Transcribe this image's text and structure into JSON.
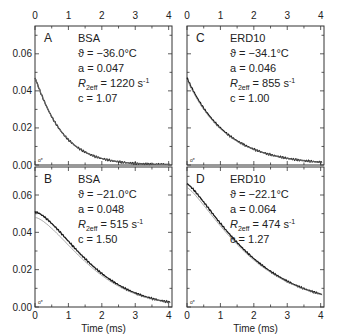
{
  "figure": {
    "top_axis_ticks": [
      "0",
      "1",
      "2",
      "3",
      "4"
    ],
    "bottom_axis_ticks": [
      "0",
      "1",
      "2",
      "3",
      "4"
    ],
    "xlabel": "Time (ms)",
    "y_ticks": [
      "0.00",
      "0.02",
      "0.04",
      "0.06"
    ]
  },
  "chart_data": [
    {
      "type": "line",
      "panel": "A",
      "sample": "BSA",
      "annotations": {
        "theta": "ϑ = −36.0°C",
        "a": "a = 0.047",
        "r2eff_value": "= 1220 s",
        "c": "c = 1.07"
      },
      "params": {
        "theta_C": -36.0,
        "a": 0.047,
        "R2eff_per_s": 1220,
        "c": 1.07
      },
      "x": [
        0,
        0.25,
        0.5,
        0.75,
        1,
        1.5,
        2,
        2.5,
        3,
        3.5,
        4
      ],
      "values": [
        0.047,
        0.034,
        0.025,
        0.018,
        0.013,
        0.007,
        0.004,
        0.002,
        0.001,
        0.0005,
        0.0003
      ],
      "xlabel": "",
      "ylabel": "",
      "xlim": [
        0,
        4.1
      ],
      "ylim": [
        0,
        0.075
      ]
    },
    {
      "type": "line",
      "panel": "B",
      "sample": "BSA",
      "annotations": {
        "theta": "ϑ = −21.0°C",
        "a": "a = 0.048",
        "r2eff_value": "= 515 s",
        "c": "c = 1.50"
      },
      "params": {
        "theta_C": -21.0,
        "a": 0.048,
        "R2eff_per_s": 515,
        "c": 1.5
      },
      "x": [
        0,
        0.25,
        0.5,
        0.75,
        1,
        1.5,
        2,
        2.5,
        3,
        3.5,
        4
      ],
      "values": [
        0.051,
        0.046,
        0.041,
        0.036,
        0.031,
        0.022,
        0.015,
        0.01,
        0.006,
        0.004,
        0.002
      ],
      "xlabel": "Time (ms)",
      "ylabel": "",
      "xlim": [
        0,
        4.1
      ],
      "ylim": [
        0,
        0.075
      ]
    },
    {
      "type": "line",
      "panel": "C",
      "sample": "ERD10",
      "annotations": {
        "theta": "ϑ = −34.1°C",
        "a": "a = 0.046",
        "r2eff_value": "= 855 s",
        "c": "c = 1.00"
      },
      "params": {
        "theta_C": -34.1,
        "a": 0.046,
        "R2eff_per_s": 855,
        "c": 1.0
      },
      "x": [
        0,
        0.25,
        0.5,
        0.75,
        1,
        1.5,
        2,
        2.5,
        3,
        3.5,
        4
      ],
      "values": [
        0.047,
        0.037,
        0.03,
        0.024,
        0.019,
        0.013,
        0.008,
        0.005,
        0.004,
        0.002,
        0.0015
      ],
      "xlabel": "",
      "ylabel": "",
      "xlim": [
        0,
        4.1
      ],
      "ylim": [
        0,
        0.075
      ]
    },
    {
      "type": "line",
      "panel": "D",
      "sample": "ERD10",
      "annotations": {
        "theta": "ϑ = −22.1°C",
        "a": "a = 0.064",
        "r2eff_value": "= 474 s",
        "c": "c = 1.27"
      },
      "params": {
        "theta_C": -22.1,
        "a": 0.064,
        "R2eff_per_s": 474,
        "c": 1.27
      },
      "x": [
        0,
        0.25,
        0.5,
        0.75,
        1,
        1.5,
        2,
        2.5,
        3,
        3.5,
        4
      ],
      "values": [
        0.066,
        0.055,
        0.045,
        0.036,
        0.028,
        0.016,
        0.008,
        0.004,
        0.002,
        0.001,
        0.0008
      ],
      "xlabel": "Time (ms)",
      "ylabel": "",
      "xlim": [
        0,
        4.1
      ],
      "ylim": [
        0,
        0.075
      ]
    }
  ]
}
